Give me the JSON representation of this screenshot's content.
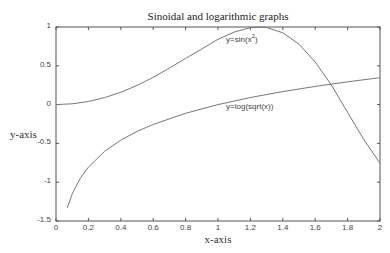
{
  "chart_data": {
    "type": "line",
    "title": "Sinoidal and logarithmic graphs",
    "xlabel": "x-axis",
    "ylabel": "y-axis",
    "xlim": [
      0,
      2
    ],
    "ylim": [
      -1.5,
      1
    ],
    "grid": false,
    "legend": "none (inline annotations)",
    "xticks": [
      "0",
      "0.2",
      "0.4",
      "0.6",
      "0.8",
      "1",
      "1.2",
      "1.4",
      "1.6",
      "1.8",
      "2"
    ],
    "yticks": [
      "1",
      "0.5",
      "0",
      "-0.5",
      "-1",
      "-1.5"
    ],
    "series": [
      {
        "name": "y=sin(x^2)",
        "x": [
          0,
          0.1,
          0.2,
          0.3,
          0.4,
          0.5,
          0.6,
          0.7,
          0.8,
          0.9,
          1.0,
          1.1,
          1.2,
          1.25,
          1.3,
          1.4,
          1.5,
          1.6,
          1.7,
          1.8,
          1.9,
          2.0
        ],
        "y": [
          0,
          0.01,
          0.04,
          0.09,
          0.159,
          0.247,
          0.352,
          0.47,
          0.595,
          0.717,
          0.841,
          0.935,
          0.991,
          1.0,
          0.993,
          0.925,
          0.778,
          0.549,
          0.252,
          -0.1,
          -0.45,
          -0.757
        ]
      },
      {
        "name": "y=log(sqrt(x))",
        "x": [
          0.07,
          0.1,
          0.15,
          0.2,
          0.3,
          0.4,
          0.5,
          0.6,
          0.8,
          1.0,
          1.2,
          1.4,
          1.6,
          1.8,
          2.0
        ],
        "y": [
          -1.33,
          -1.151,
          -0.949,
          -0.805,
          -0.602,
          -0.458,
          -0.347,
          -0.255,
          -0.112,
          0,
          0.091,
          0.168,
          0.235,
          0.294,
          0.347
        ]
      }
    ],
    "annotations": [
      {
        "text_base": "y=sin(x",
        "text_sup": "2",
        "text_end": ")",
        "x": 1.05,
        "y": 0.82
      },
      {
        "text": "y=log(sqrt(x))",
        "x": 1.05,
        "y": -0.07
      }
    ]
  },
  "colors": {
    "axis": "#555555",
    "line": "#777777",
    "text": "#333333"
  }
}
